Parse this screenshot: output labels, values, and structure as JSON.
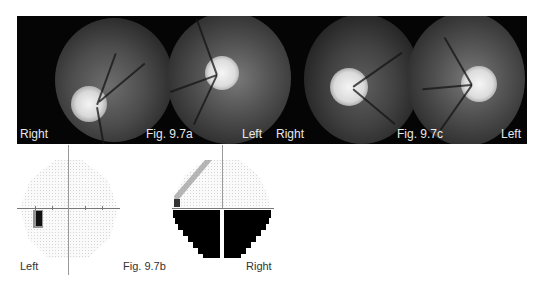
{
  "figure": {
    "fundus_strip": {
      "panels": [
        {
          "id": "a-right",
          "eye": "Right"
        },
        {
          "id": "a-left",
          "eye": "Left"
        },
        {
          "id": "c-right",
          "eye": "Right"
        },
        {
          "id": "c-left",
          "eye": "Left"
        }
      ],
      "labels": {
        "a_right": "Right",
        "a_caption": "Fig. 9.7a",
        "a_left": "Left",
        "c_right": "Right",
        "c_caption": "Fig. 9.7c",
        "c_left": "Left"
      }
    },
    "visual_fields": {
      "left_label": "Left",
      "caption": "Fig. 9.7b",
      "right_label": "Right",
      "left_field": {
        "defect": "small paracentral scotoma, inferior nasal"
      },
      "right_field": {
        "defect": "dense inferior altitudinal defect"
      }
    }
  },
  "colors": {
    "strip_bg": "#050505",
    "label_text": "#e8e8e8",
    "defect": "#000000",
    "axis": "#777777"
  }
}
